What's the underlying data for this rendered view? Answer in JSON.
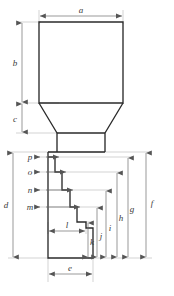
{
  "drawing": {
    "title": "Stepped punch profile dimension drawing",
    "canvas": {
      "width": 174,
      "height": 296
    },
    "colors": {
      "outline": "#2b2b2b",
      "dimension": "#8a8a8a",
      "label": "#3a3a3a",
      "background": "#ffffff"
    },
    "labels": {
      "a": "a",
      "b": "b",
      "c": "c",
      "d": "d",
      "e": "e",
      "f": "f",
      "g": "g",
      "h": "h",
      "i": "i",
      "j": "j",
      "k": "k",
      "l": "l",
      "m": "m",
      "n": "n",
      "o": "o",
      "p": "p"
    },
    "dimensions": {
      "horizontal": [
        {
          "id": "a",
          "label": "a",
          "orientation": "horizontal",
          "position": "top",
          "from_x": 39,
          "to_x": 123,
          "y": 16,
          "describes": "overall head width"
        },
        {
          "id": "e",
          "label": "e",
          "orientation": "horizontal",
          "position": "bottom",
          "from_x": 48,
          "to_x": 93,
          "y": 274,
          "describes": "shank width"
        },
        {
          "id": "l",
          "label": "l",
          "orientation": "horizontal",
          "position": "inner",
          "from_x": 48,
          "to_x": 86,
          "y": 228,
          "describes": "width to lowest step"
        }
      ],
      "vertical_left": [
        {
          "id": "b",
          "label": "b",
          "orientation": "vertical",
          "from_y": 22,
          "to_y": 103,
          "x": 22,
          "describes": "head height"
        },
        {
          "id": "c",
          "label": "c",
          "orientation": "vertical",
          "from_y": 103,
          "to_y": 133,
          "x": 22,
          "describes": "taper height"
        },
        {
          "id": "d",
          "label": "d",
          "orientation": "vertical",
          "from_y": 152,
          "to_y": 258,
          "x": 13,
          "describes": "stepped shank height"
        }
      ],
      "vertical_right": [
        {
          "id": "k",
          "label": "k",
          "orientation": "vertical",
          "from_y": 258,
          "to_y": 222,
          "x": 88,
          "describes": "height to step 4"
        },
        {
          "id": "j",
          "label": "j",
          "orientation": "vertical",
          "from_y": 258,
          "to_y": 207,
          "x": 97,
          "describes": "height to step 3"
        },
        {
          "id": "i",
          "label": "i",
          "orientation": "vertical",
          "from_y": 258,
          "to_y": 190,
          "x": 106,
          "describes": "height to step 2"
        },
        {
          "id": "h",
          "label": "h",
          "orientation": "vertical",
          "from_y": 258,
          "to_y": 171,
          "x": 117,
          "describes": "height to step 1"
        },
        {
          "id": "g",
          "label": "g",
          "orientation": "vertical",
          "from_y": 258,
          "to_y": 157,
          "x": 128,
          "describes": "height to shoulder"
        },
        {
          "id": "f",
          "label": "f",
          "orientation": "vertical",
          "from_y": 258,
          "to_y": 152,
          "x": 146,
          "describes": "overall shank height"
        }
      ],
      "step_arrows_left": [
        {
          "id": "p",
          "label": "p",
          "y": 157,
          "tip_x": 60,
          "describes": "step 1 width offset"
        },
        {
          "id": "o",
          "label": "o",
          "y": 172,
          "tip_x": 67,
          "describes": "step 2 width offset"
        },
        {
          "id": "n",
          "label": "n",
          "y": 190,
          "tip_x": 74,
          "describes": "step 3 width offset"
        },
        {
          "id": "m",
          "label": "m",
          "y": 207,
          "tip_x": 81,
          "describes": "step 4 width offset"
        }
      ]
    },
    "geometry": {
      "head": {
        "left": 39,
        "right": 123,
        "top": 22,
        "bottom": 103
      },
      "taper": {
        "top_left": 39,
        "top_right": 123,
        "bottom_left": 57,
        "bottom_right": 105,
        "top": 103,
        "bottom": 133
      },
      "neck": {
        "left": 57,
        "right": 105,
        "top": 133,
        "bottom": 152
      },
      "shank_left": 48,
      "shank_bottom": 258,
      "steps": [
        {
          "index": 1,
          "x": 48,
          "y": 152
        },
        {
          "index": 2,
          "x": 55,
          "y": 157
        },
        {
          "index": 3,
          "x": 62,
          "y": 172
        },
        {
          "index": 4,
          "x": 70,
          "y": 190
        },
        {
          "index": 5,
          "x": 77,
          "y": 207
        },
        {
          "index": 6,
          "x": 86,
          "y": 222
        },
        {
          "index": 7,
          "x": 93,
          "y": 228
        }
      ]
    }
  }
}
